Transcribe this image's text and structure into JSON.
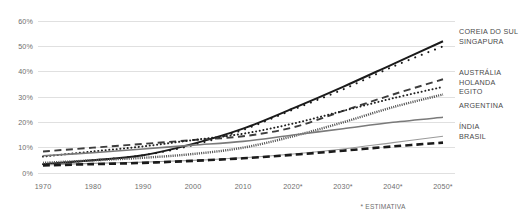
{
  "footnote": "* ESTIMATIVA",
  "axes": {
    "y_ticks": [
      "0%",
      "10%",
      "20%",
      "30%",
      "40%",
      "50%",
      "60%"
    ],
    "x_ticks": [
      "1970",
      "1980",
      "1990",
      "2000",
      "2010",
      "2020*",
      "2030*",
      "2040*",
      "2050*"
    ]
  },
  "legend": {
    "groups": [
      {
        "labels": [
          "COREIA DO SUL",
          "SINGAPURA"
        ]
      },
      {
        "labels": [
          "AUSTRÁLIA",
          "HOLANDA",
          "EGITO"
        ]
      },
      {
        "labels": [
          "ARGENTINA"
        ]
      },
      {
        "labels": [
          "ÍNDIA",
          "BRASIL"
        ]
      }
    ]
  },
  "colors": {
    "grid": "#d8d8d8",
    "axis_text": "#6e6e6e",
    "legend_text": "#4a4a4a",
    "coreia": "#1a1a1a",
    "singapura": "#1a1a1a",
    "australia": "#3d3d3d",
    "holanda": "#222222",
    "egito": "#555555",
    "argentina": "#7a7a7a",
    "india": "#9a9a9a",
    "brasil": "#1a1a1a",
    "background": "#ffffff"
  },
  "chart_data": {
    "type": "line",
    "title": "",
    "subtitle": "",
    "xlabel": "",
    "ylabel": "",
    "xlim": [
      1970,
      2050
    ],
    "ylim": [
      0,
      60
    ],
    "grid": true,
    "legend_position": "right",
    "annotations": [
      "* ESTIMATIVA"
    ],
    "x": [
      1970,
      1980,
      1990,
      2000,
      2010,
      2020,
      2030,
      2040,
      2050
    ],
    "series": [
      {
        "name": "COREIA DO SUL",
        "style": "solid-thick",
        "color": "#1a1a1a",
        "values": [
          3.5,
          5.0,
          7.0,
          11.5,
          17.5,
          25.5,
          34.0,
          43.0,
          52.0
        ]
      },
      {
        "name": "SINGAPURA",
        "style": "dotted-sparse",
        "color": "#1a1a1a",
        "values": [
          3.5,
          5.0,
          7.0,
          11.0,
          17.0,
          25.0,
          33.0,
          42.0,
          50.0
        ]
      },
      {
        "name": "AUSTRÁLIA",
        "style": "dashed",
        "color": "#3d3d3d",
        "values": [
          8.5,
          10.0,
          11.5,
          13.0,
          14.5,
          18.0,
          24.5,
          31.0,
          37.0
        ]
      },
      {
        "name": "HOLANDA",
        "style": "dotted-dense",
        "color": "#222222",
        "values": [
          6.5,
          8.5,
          10.5,
          13.0,
          15.5,
          19.5,
          24.5,
          29.5,
          34.0
        ]
      },
      {
        "name": "EGITO",
        "style": "hatched",
        "color": "#555555",
        "values": [
          4.0,
          5.0,
          6.0,
          7.5,
          10.0,
          14.5,
          20.0,
          26.0,
          31.0
        ]
      },
      {
        "name": "ARGENTINA",
        "style": "solid-medium",
        "color": "#7a7a7a",
        "values": [
          6.8,
          8.0,
          9.5,
          11.0,
          12.5,
          15.0,
          17.5,
          20.0,
          22.0
        ]
      },
      {
        "name": "ÍNDIA",
        "style": "solid-thin",
        "color": "#9a9a9a",
        "values": [
          3.2,
          3.8,
          4.3,
          5.0,
          6.0,
          7.5,
          9.5,
          12.0,
          14.5
        ]
      },
      {
        "name": "BRASIL",
        "style": "dashed-thick",
        "color": "#1a1a1a",
        "values": [
          3.0,
          3.5,
          4.0,
          4.8,
          5.8,
          7.2,
          8.8,
          10.5,
          12.0
        ]
      }
    ]
  }
}
